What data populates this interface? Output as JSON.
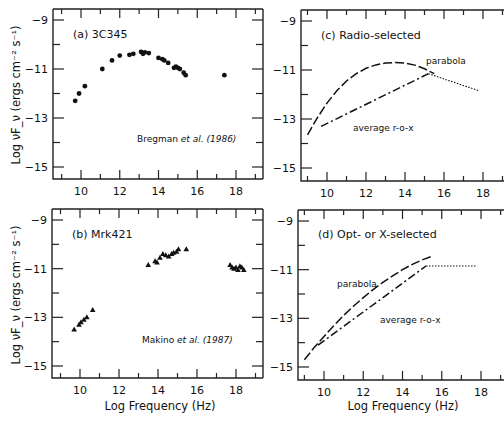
{
  "figure": {
    "ylabel": "Log νF_ν (ergs cm⁻² s⁻¹)",
    "xlabel": "Log Frequency (Hz)"
  },
  "chart_data": [
    {
      "id": "a",
      "type": "scatter",
      "title": "(a) 3C345",
      "annotation": "Bregman et al. (1986)",
      "marker": "circle",
      "xlabel": "",
      "ylabel": "Log νF_ν (ergs cm⁻² s⁻¹)",
      "xlim": [
        8.6,
        19.1
      ],
      "ylim": [
        -15.5,
        -8.6
      ],
      "xticks": [
        10,
        12,
        14,
        16,
        18
      ],
      "yticks": [
        -9,
        -11,
        -13,
        -15
      ],
      "x": [
        9.7,
        9.9,
        10.2,
        11.1,
        11.6,
        12.0,
        12.5,
        12.7,
        13.1,
        13.2,
        13.3,
        13.5,
        14.0,
        14.2,
        14.3,
        14.5,
        14.8,
        14.9,
        15.0,
        15.1,
        15.3,
        15.4,
        17.4
      ],
      "y": [
        -12.3,
        -12.0,
        -11.7,
        -11.0,
        -10.65,
        -10.45,
        -10.42,
        -10.38,
        -10.3,
        -10.38,
        -10.32,
        -10.35,
        -10.55,
        -10.6,
        -10.65,
        -10.75,
        -10.95,
        -10.9,
        -10.95,
        -11.0,
        -11.15,
        -11.25,
        -11.25
      ]
    },
    {
      "id": "b",
      "type": "scatter",
      "title": "(b) Mrk421",
      "annotation": "Makino et al. (1987)",
      "marker": "triangle",
      "xlabel": "Log Frequency (Hz)",
      "ylabel": "Log νF_ν (ergs cm⁻² s⁻¹)",
      "xlim": [
        8.6,
        19.1
      ],
      "ylim": [
        -15.5,
        -8.6
      ],
      "xticks": [
        10,
        12,
        14,
        16,
        18
      ],
      "yticks": [
        -9,
        -11,
        -13,
        -15
      ],
      "x": [
        9.7,
        9.95,
        10.05,
        10.2,
        10.35,
        10.65,
        13.5,
        13.85,
        13.95,
        14.1,
        14.25,
        14.4,
        14.55,
        14.7,
        14.8,
        14.95,
        15.05,
        15.45,
        17.7,
        17.8,
        17.9,
        18.0,
        18.1,
        18.2,
        18.3,
        18.4
      ],
      "y": [
        -13.5,
        -13.3,
        -13.2,
        -13.1,
        -13.0,
        -12.7,
        -10.85,
        -10.7,
        -10.75,
        -10.55,
        -10.4,
        -10.45,
        -10.5,
        -10.4,
        -10.35,
        -10.3,
        -10.2,
        -10.2,
        -10.85,
        -10.95,
        -11.0,
        -10.95,
        -11.05,
        -10.9,
        -10.95,
        -11.05
      ]
    },
    {
      "id": "c",
      "type": "line",
      "title": "(c) Radio-selected",
      "xlabel": "",
      "xlim": [
        8.6,
        19.1
      ],
      "ylim": [
        -15.5,
        -8.6
      ],
      "xticks": [
        10,
        12,
        14,
        16,
        18
      ],
      "yticks": [
        -9,
        -11,
        -13,
        -15
      ],
      "series": [
        {
          "name": "parabola",
          "style": "dashed",
          "x": [
            9.0,
            9.5,
            10.0,
            10.5,
            11.0,
            11.5,
            12.0,
            12.5,
            13.0,
            13.5,
            14.0,
            14.5,
            15.0,
            15.5
          ],
          "y": [
            -13.65,
            -12.95,
            -12.35,
            -11.85,
            -11.45,
            -11.15,
            -10.93,
            -10.79,
            -10.72,
            -10.7,
            -10.72,
            -10.8,
            -10.95,
            -11.15
          ]
        },
        {
          "name": "average r-o-x",
          "style": "dashdot",
          "x": [
            9.7,
            15.2
          ],
          "y": [
            -13.3,
            -11.15
          ]
        },
        {
          "name": "average r-o-x (X-ray extension)",
          "style": "dotted",
          "x": [
            15.2,
            17.8
          ],
          "y": [
            -11.15,
            -11.85
          ]
        }
      ],
      "labels": {
        "parabola": "parabola",
        "average": "average r-o-x"
      }
    },
    {
      "id": "d",
      "type": "line",
      "title": "(d) Opt- or X-selected",
      "xlabel": "Log Frequency (Hz)",
      "xlim": [
        8.6,
        19.1
      ],
      "ylim": [
        -15.5,
        -8.6
      ],
      "xticks": [
        10,
        12,
        14,
        16,
        18
      ],
      "yticks": [
        -9,
        -11,
        -13,
        -15
      ],
      "series": [
        {
          "name": "parabola",
          "style": "dashed",
          "x": [
            9.0,
            9.5,
            10.0,
            10.5,
            11.0,
            11.5,
            12.0,
            12.5,
            13.0,
            13.5,
            14.0,
            14.5,
            15.0,
            15.5
          ],
          "y": [
            -14.7,
            -14.2,
            -13.75,
            -13.3,
            -12.88,
            -12.5,
            -12.15,
            -11.82,
            -11.52,
            -11.25,
            -11.0,
            -10.78,
            -10.6,
            -10.45
          ]
        },
        {
          "name": "average r-o-x",
          "style": "dashdot",
          "x": [
            9.7,
            15.2
          ],
          "y": [
            -14.1,
            -10.85
          ]
        },
        {
          "name": "average r-o-x (X-ray extension)",
          "style": "dotted",
          "x": [
            15.2,
            17.8
          ],
          "y": [
            -10.85,
            -10.85
          ]
        }
      ],
      "labels": {
        "parabola": "parabola",
        "average": "average r-o-x"
      }
    }
  ]
}
